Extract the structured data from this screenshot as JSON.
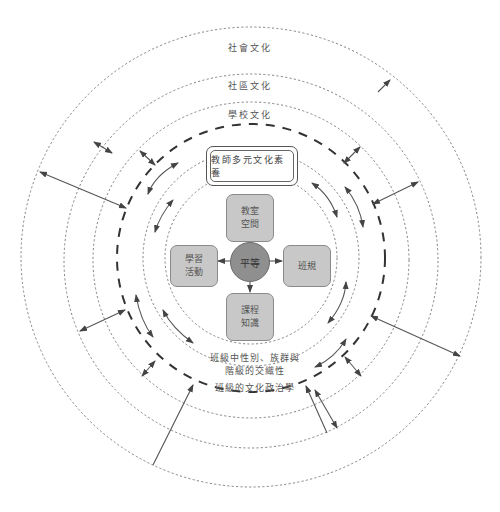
{
  "diagram": {
    "center": {
      "x": 250,
      "y": 260
    },
    "colors": {
      "ring_stroke": "#777777",
      "bold_ring_stroke": "#333333",
      "node_fill": "#c8c8c8",
      "core_fill": "#8f8f8f",
      "arrow": "#555555"
    },
    "rings": [
      {
        "id": "society",
        "r": 230,
        "style": "dotted"
      },
      {
        "id": "community",
        "r": 187,
        "style": "dotted"
      },
      {
        "id": "school",
        "r": 158,
        "style": "dotted"
      },
      {
        "id": "class-politics",
        "r": 133,
        "style": "bold-dashed"
      },
      {
        "id": "class-intersectionality",
        "r": 110,
        "style": "dotted"
      },
      {
        "id": "core-zone",
        "r": 86,
        "style": "dotted"
      }
    ],
    "ring_labels": {
      "society": "社會文化",
      "community": "社區文化",
      "school": "學校文化",
      "class_intersectionality_line1": "班級中性別、族群與",
      "class_intersectionality_line2": "階級的交織性",
      "class_politics": "班級的文化政治學"
    },
    "teacher_box": {
      "label": "教師多元文化素養"
    },
    "core": {
      "label": "平等"
    },
    "nodes": {
      "top": {
        "line1": "教室",
        "line2": "空間"
      },
      "left": {
        "line1": "學習",
        "line2": "活動"
      },
      "right": {
        "line1": "班規",
        "line2": ""
      },
      "bottom": {
        "line1": "課程",
        "line2": "知識"
      }
    }
  }
}
